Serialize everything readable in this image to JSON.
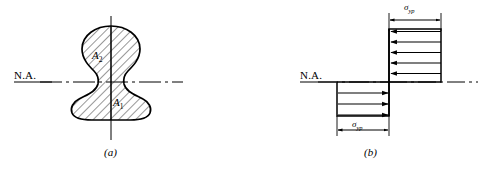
{
  "figure": {
    "title_a_caption": "(a)",
    "title_b_caption": "(b)",
    "na_label_left": "N.A.",
    "na_label_right": "N.A.",
    "area_upper": "A",
    "area_upper_sub": "2",
    "area_lower": "A",
    "area_lower_sub": "1",
    "sigma_symbol": "σ",
    "sigma_subscript": "yp",
    "colors": {
      "ink": "#000000",
      "paper": "#ffffff",
      "hatch": "#1a1a1a"
    }
  },
  "panel_a": {
    "name": "cross-section-mushroom",
    "centerline": "vertical-centerline",
    "neutral_axis": "dash-dot-neutral-axis",
    "hatch_angle_deg": 45,
    "labels": [
      "A2",
      "A1"
    ]
  },
  "panel_b": {
    "name": "plastic-stress-distribution",
    "upper_block": {
      "arrow_direction": "left",
      "arrow_count": 5,
      "dimension_label": "σyp",
      "dimension_position": "top"
    },
    "lower_block": {
      "arrow_direction": "right",
      "arrow_count": 3,
      "dimension_label": "σyp",
      "dimension_position": "bottom"
    },
    "neutral_axis": "dash-dot-neutral-axis"
  }
}
